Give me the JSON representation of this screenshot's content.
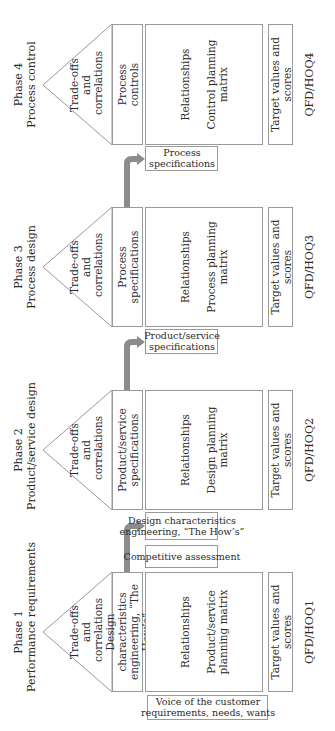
{
  "orientation": "rotated-90-ccw",
  "colors": {
    "border": "#9a9a9a",
    "arrow": "#8c8c8c",
    "text": "#2a2a2a"
  },
  "phases": [
    {
      "phase": "Phase 1",
      "title": "Performance requirements",
      "roof": "Trade-offs\nand\ncorrelations",
      "roof_lines": [
        "Trade-offs",
        "and",
        "correlations"
      ],
      "specs_lines": [
        "Design characteristics",
        "engineering, “The How’s”"
      ],
      "matrix_title": "Relationships",
      "matrix_lines": [
        "Product/service",
        "planning matrix"
      ],
      "target": "Target values and scores",
      "qfd": "QFD/HOQ1"
    },
    {
      "phase": "Phase 2",
      "title": "Product/service design",
      "roof_lines": [
        "Trade-offs",
        "and",
        "correlations"
      ],
      "specs_lines": [
        "Product/service",
        "specifications"
      ],
      "matrix_title": "Relationships",
      "matrix_lines": [
        "Design planning",
        "matrix"
      ],
      "target": "Target values and scores",
      "qfd": "QFD/HOQ2"
    },
    {
      "phase": "Phase 3",
      "title": "Process design",
      "roof_lines": [
        "Trade-offs",
        "and",
        "correlations"
      ],
      "specs_lines": [
        "Process",
        "specifications"
      ],
      "matrix_title": "Relationships",
      "matrix_lines": [
        "Process planning",
        "matrix"
      ],
      "target": "Target values and scores",
      "qfd": "QFD/HOQ3"
    },
    {
      "phase": "Phase 4",
      "title": "Process control",
      "roof_lines": [
        "Trade-offs",
        "and",
        "correlations"
      ],
      "specs_lines": [
        "Process",
        "controls"
      ],
      "matrix_title": "Relationships",
      "matrix_lines": [
        "Control planning",
        "matrix"
      ],
      "target": "Target values and scores",
      "qfd": "QFD/HOQ4"
    }
  ],
  "side_boxes": {
    "voice_of_customer": [
      "Voice of the customer",
      "requirements, needs, wants"
    ],
    "competitive_assessment": "Competitive assessment",
    "input_phase2": [
      "Design characteristics",
      "engineering, “The How’s”"
    ],
    "input_phase3": [
      "Product/service",
      "specifications"
    ],
    "input_phase4": [
      "Process",
      "specifications"
    ]
  }
}
